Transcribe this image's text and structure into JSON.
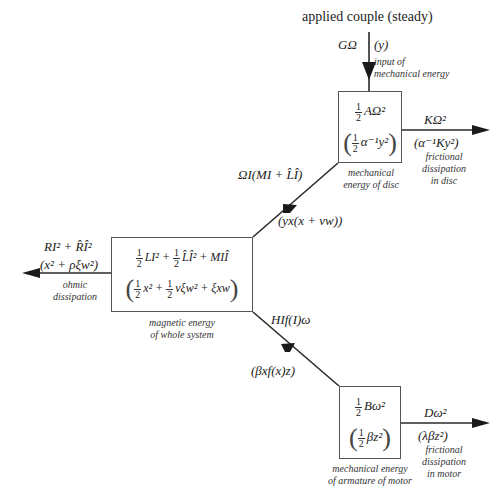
{
  "diagram": {
    "type": "energy-flow",
    "top_input": {
      "label": "applied couple (steady)",
      "power": "GΩ",
      "power_scaled": "(y)",
      "caption_line1": "input of",
      "caption_line2": "mechanical energy"
    },
    "disc_box": {
      "frac": {
        "num": "1",
        "den": "2"
      },
      "main": "AΩ²",
      "scaled_frac": {
        "num": "1",
        "den": "2"
      },
      "scaled": "α⁻¹y²",
      "caption_line1": "mechanical",
      "caption_line2": "energy of disc"
    },
    "disc_loss": {
      "power": "KΩ²",
      "scaled": "(α⁻¹Ky²)",
      "caption_line1": "frictional",
      "caption_line2": "dissipation",
      "caption_line3": "in disc"
    },
    "disc_to_magnetic": {
      "power": "ΩI(MI + L̂Î)",
      "scaled": "(yx(x + νw))"
    },
    "magnetic_box": {
      "line1": {
        "f1": {
          "num": "1",
          "den": "2"
        },
        "t1": "LI² +",
        "f2": {
          "num": "1",
          "den": "2"
        },
        "t2": "L̂Î² + MIÎ"
      },
      "line2": {
        "f1": {
          "num": "1",
          "den": "2"
        },
        "t1": "x² +",
        "f2": {
          "num": "1",
          "den": "2"
        },
        "t2": "νξw² + ξxw"
      },
      "caption_line1": "magnetic energy",
      "caption_line2": "of whole system"
    },
    "ohmic_loss": {
      "power": "RI² + R̂Î²",
      "scaled": "(x² + ρξw²)",
      "caption_line1": "ohmic",
      "caption_line2": "dissipation"
    },
    "magnetic_to_motor": {
      "power": "HIf(I)ω",
      "scaled": "(βxf(x)z)"
    },
    "motor_box": {
      "frac": {
        "num": "1",
        "den": "2"
      },
      "main": "Bω²",
      "scaled_frac": {
        "num": "1",
        "den": "2"
      },
      "scaled": "βz²",
      "caption_line1": "mechanical energy",
      "caption_line2": "of armature of motor"
    },
    "motor_loss": {
      "power": "Dω²",
      "scaled": "(λβz²)",
      "caption_line1": "frictional",
      "caption_line2": "dissipation",
      "caption_line3": "in motor"
    },
    "colors": {
      "line": "#2a2a2a",
      "box_border": "#555555",
      "text": "#222222"
    }
  }
}
